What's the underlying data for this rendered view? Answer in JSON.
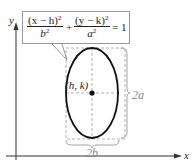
{
  "diagram": {
    "type": "ellipse-vertical-major-axis",
    "equation": {
      "term1_numerator": "(x − h)",
      "term1_denominator": "b",
      "term2_numerator": "(y − k)",
      "term2_denominator": "a",
      "exponent": "2",
      "plus": "+",
      "equals": "= 1"
    },
    "axes": {
      "x_label": "x",
      "y_label": "y"
    },
    "center_label": "(h, k)",
    "major_axis_label": "2a",
    "minor_axis_label": "2b",
    "colors": {
      "ellipse_stroke": "#111111",
      "axis": "#333333",
      "dashed": "#999999",
      "brace": "#9a9a9a"
    }
  }
}
